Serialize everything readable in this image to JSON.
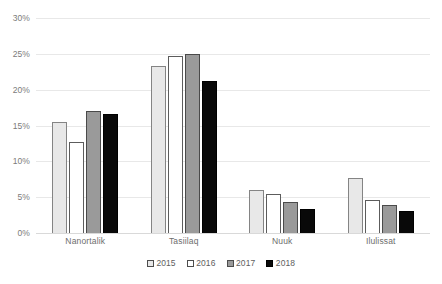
{
  "chart_data": {
    "type": "bar",
    "title": "",
    "subtitle": "",
    "xlabel": "",
    "ylabel": "",
    "categories": [
      "Nanortalik",
      "Tasiilaq",
      "Nuuk",
      "Ilulissat"
    ],
    "series": [
      {
        "name": "2015",
        "color": "#e8e8e8",
        "values": [
          15.5,
          23.3,
          6.0,
          7.7
        ]
      },
      {
        "name": "2016",
        "color": "#ffffff",
        "values": [
          12.7,
          24.7,
          5.4,
          4.6
        ]
      },
      {
        "name": "2017",
        "color": "#9a9a9a",
        "values": [
          17.0,
          25.0,
          4.3,
          3.9
        ]
      },
      {
        "name": "2018",
        "color": "#0a0a0a",
        "values": [
          16.6,
          21.2,
          3.4,
          3.1
        ]
      }
    ],
    "ylim": [
      0,
      30
    ],
    "yticks": [
      0,
      5,
      10,
      15,
      20,
      25,
      30
    ],
    "ytick_labels": [
      "0%",
      "5%",
      "10%",
      "15%",
      "20%",
      "25%",
      "30%"
    ],
    "grid": true,
    "legend_position": "bottom",
    "value_format": "percent"
  }
}
